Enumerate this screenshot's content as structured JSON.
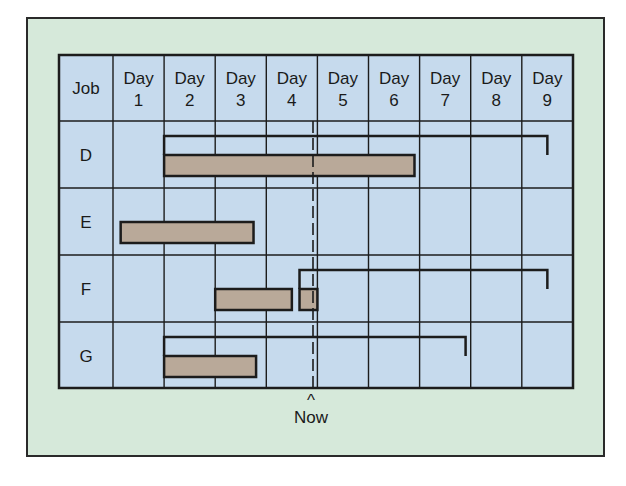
{
  "chart_data": {
    "type": "gantt",
    "title": "",
    "columns": [
      "Job",
      "Day 1",
      "Day 2",
      "Day 3",
      "Day 4",
      "Day 5",
      "Day 6",
      "Day 7",
      "Day 8",
      "Day 9"
    ],
    "header": {
      "job_label": "Job",
      "days": [
        {
          "line1": "Day",
          "line2": "1"
        },
        {
          "line1": "Day",
          "line2": "2"
        },
        {
          "line1": "Day",
          "line2": "3"
        },
        {
          "line1": "Day",
          "line2": "4"
        },
        {
          "line1": "Day",
          "line2": "5"
        },
        {
          "line1": "Day",
          "line2": "6"
        },
        {
          "line1": "Day",
          "line2": "7"
        },
        {
          "line1": "Day",
          "line2": "8"
        },
        {
          "line1": "Day",
          "line2": "9"
        }
      ]
    },
    "jobs": [
      {
        "name": "D",
        "scheduled": {
          "start_day": 2,
          "end_day": 9.5
        },
        "actual": [
          {
            "start_day": 2,
            "end_day": 6.9
          }
        ]
      },
      {
        "name": "E",
        "scheduled": null,
        "actual": [
          {
            "start_day": 1.15,
            "end_day": 3.75
          }
        ]
      },
      {
        "name": "F",
        "scheduled": {
          "start_day": 4.65,
          "end_day": 9.5
        },
        "actual": [
          {
            "start_day": 3,
            "end_day": 4.5
          },
          {
            "start_day": 4.65,
            "end_day": 5.0
          }
        ]
      },
      {
        "name": "G",
        "scheduled": {
          "start_day": 2,
          "end_day": 7.9
        },
        "actual": [
          {
            "start_day": 2,
            "end_day": 3.8
          }
        ]
      }
    ],
    "now_marker": {
      "day": 4.9,
      "label": "Now",
      "caret": "^"
    }
  },
  "colors": {
    "panel_bg": "#d6e9da",
    "grid_bg": "#c6daed",
    "bar_fill": "#b9a999",
    "line": "#1c1c1c"
  }
}
